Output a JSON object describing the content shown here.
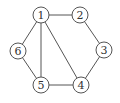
{
  "graph": {
    "title": "",
    "colors": {
      "stroke": "#555555",
      "fill": "#ffffff",
      "text": "#333333"
    },
    "node_radius": 8,
    "nodes": [
      {
        "id": "1",
        "label": "1",
        "x": 41,
        "y": 15
      },
      {
        "id": "2",
        "label": "2",
        "x": 80,
        "y": 15
      },
      {
        "id": "3",
        "label": "3",
        "x": 104,
        "y": 50
      },
      {
        "id": "4",
        "label": "4",
        "x": 81,
        "y": 85
      },
      {
        "id": "5",
        "label": "5",
        "x": 41,
        "y": 85
      },
      {
        "id": "6",
        "label": "6",
        "x": 18,
        "y": 51
      }
    ],
    "edges": [
      {
        "from": "1",
        "to": "2"
      },
      {
        "from": "2",
        "to": "3"
      },
      {
        "from": "3",
        "to": "4"
      },
      {
        "from": "4",
        "to": "5"
      },
      {
        "from": "5",
        "to": "6"
      },
      {
        "from": "6",
        "to": "1"
      },
      {
        "from": "1",
        "to": "5"
      },
      {
        "from": "1",
        "to": "4"
      }
    ]
  }
}
